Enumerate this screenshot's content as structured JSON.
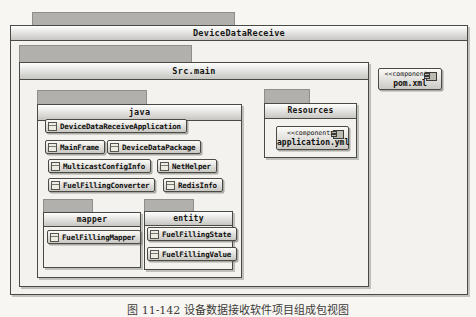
{
  "root": {
    "name": "DeviceDataReceive"
  },
  "src_main": {
    "name": "Src.main"
  },
  "java": {
    "name": "java",
    "classes": [
      "DeviceDataReceiveApplication",
      "MainFrame",
      "DeviceDataPackage",
      "MulticastConfigInfo",
      "NetHelper",
      "FuelFillingConverter",
      "RedisInfo"
    ]
  },
  "mapper": {
    "name": "mapper",
    "classes": [
      "FuelFillingMapper"
    ]
  },
  "entity": {
    "name": "entity",
    "classes": [
      "FuelFillingState",
      "FuelFillingValue"
    ]
  },
  "resources": {
    "name": "Resources"
  },
  "components": {
    "application_yml": {
      "stereotype": "<<component>>",
      "name": "application.yml"
    },
    "pom_xml": {
      "stereotype": "<<component>>",
      "name": "pom.xml"
    }
  },
  "caption": "图 11-142 设备数据接收软件项目组成包视图",
  "colors": {
    "page_bg": "#f7f6f3",
    "package_tab": "#b1b0ad",
    "package_body": "#f3f2ee",
    "border": "#4a4a45",
    "titlebar_top": "#ffffff",
    "titlebar_bottom": "#c7c6c2",
    "text": "#0e0e0c"
  }
}
